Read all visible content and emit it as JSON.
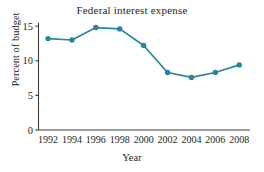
{
  "chart_data": {
    "type": "line",
    "title": "Federal interest expense",
    "xlabel": "Year",
    "ylabel": "Percent of budget",
    "x": [
      1992,
      1994,
      1996,
      1998,
      2000,
      2002,
      2004,
      2006,
      2008
    ],
    "values": [
      13.2,
      13.0,
      14.8,
      14.6,
      12.2,
      8.3,
      7.6,
      8.3,
      9.4
    ],
    "xtick_labels": [
      "1992",
      "1994",
      "1996",
      "1998",
      "2000",
      "2002",
      "2004",
      "2006",
      "2008"
    ],
    "ytick_labels": [
      "0",
      "5",
      "10",
      "15"
    ],
    "yticks": [
      0,
      5,
      10,
      15
    ],
    "ylim": [
      0,
      15.6
    ],
    "xlim": [
      1991.2,
      2008.9
    ],
    "grid": false,
    "legend": false,
    "series_color": "#2a849b",
    "marker": "circle",
    "axis_color": "#3b3b3b",
    "background_color": "#ffffff"
  }
}
